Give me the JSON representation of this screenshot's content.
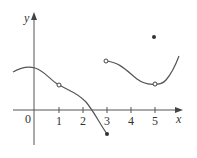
{
  "axes": {
    "x_label": "x",
    "y_label": "y",
    "origin_label": "0",
    "x_ticks": [
      "1",
      "2",
      "3",
      "4",
      "5"
    ]
  },
  "colors": {
    "axis": "#555555",
    "curve": "#555555",
    "point": "#333333"
  },
  "graph": {
    "description": "Piecewise function graph with discontinuities",
    "points": {
      "open_circles": [
        {
          "x": 1,
          "y": 1
        },
        {
          "x": 3,
          "y": 2
        },
        {
          "x": 5,
          "y": 1
        }
      ],
      "filled_dots": [
        {
          "x": 3,
          "y": -1
        },
        {
          "x": 5,
          "y": 3
        }
      ]
    }
  }
}
